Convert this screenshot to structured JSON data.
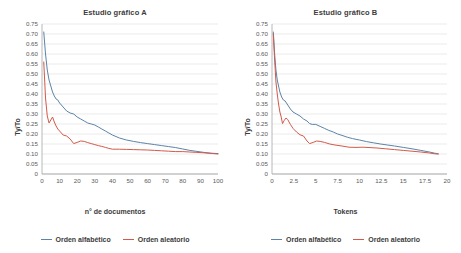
{
  "figure": {
    "background": "#ffffff",
    "series_colors": {
      "alfabetico": "#5b84a8",
      "aleatorio": "#d25a4a"
    },
    "gridline_color": "#e3e3e3",
    "axis_color": "#a6a6a6"
  },
  "legend": {
    "items": [
      {
        "label": "Orden alfabético",
        "color": "#5b84a8",
        "key": "alfabetico"
      },
      {
        "label": "Orden aleatorio",
        "color": "#d25a4a",
        "key": "aleatorio"
      }
    ]
  },
  "panel_a": {
    "title": "Estudio gráfico A",
    "xlabel": "n° de documentos",
    "ylabel": "Ty/To"
  },
  "panel_b": {
    "title": "Estudio gráfico B",
    "xlabel": "Tokens",
    "ylabel": "Ty/To"
  },
  "chart_data": [
    {
      "type": "line",
      "title": "Estudio gráfico A",
      "xlabel": "n° de documentos",
      "ylabel": "Ty/To",
      "xlim": [
        0,
        100
      ],
      "ylim": [
        0,
        0.75
      ],
      "xticks": [
        0,
        10,
        20,
        30,
        40,
        50,
        60,
        70,
        80,
        90,
        100
      ],
      "xtick_labels": [
        "0",
        "10",
        "20",
        "30",
        "40",
        "50",
        "60",
        "70",
        "80",
        "90",
        "100"
      ],
      "yticks": [
        0,
        0.05,
        0.1,
        0.15,
        0.2,
        0.25,
        0.3,
        0.35,
        0.4,
        0.45,
        0.5,
        0.55,
        0.6,
        0.65,
        0.7,
        0.75
      ],
      "ytick_labels": [
        "0",
        "0.05",
        "0.10",
        "0.15",
        "0.20",
        "0.25",
        "0.30",
        "0.35",
        "0.40",
        "0.45",
        "0.50",
        "0.55",
        "0.60",
        "0.65",
        "0.70",
        "0.75"
      ],
      "grid": "horizontal",
      "legend_position": "bottom",
      "series": [
        {
          "name": "Orden alfabético",
          "color": "#5b84a8",
          "x": [
            1,
            2,
            3,
            4,
            5,
            6,
            7,
            8,
            9,
            10,
            12,
            14,
            16,
            18,
            20,
            22,
            24,
            26,
            28,
            30,
            32,
            34,
            36,
            38,
            40,
            44,
            48,
            52,
            56,
            60,
            64,
            68,
            72,
            76,
            80,
            84,
            88,
            92,
            96,
            100
          ],
          "values": [
            0.71,
            0.6,
            0.52,
            0.47,
            0.44,
            0.41,
            0.39,
            0.375,
            0.37,
            0.355,
            0.335,
            0.315,
            0.305,
            0.3,
            0.285,
            0.275,
            0.265,
            0.255,
            0.25,
            0.245,
            0.235,
            0.225,
            0.215,
            0.205,
            0.195,
            0.18,
            0.17,
            0.163,
            0.157,
            0.152,
            0.147,
            0.142,
            0.137,
            0.132,
            0.125,
            0.118,
            0.113,
            0.108,
            0.104,
            0.102
          ]
        },
        {
          "name": "Orden aleatorio",
          "color": "#d25a4a",
          "x": [
            1,
            2,
            3,
            4,
            5,
            6,
            7,
            8,
            9,
            10,
            12,
            14,
            16,
            18,
            20,
            22,
            24,
            26,
            28,
            30,
            32,
            34,
            36,
            38,
            40,
            44,
            48,
            52,
            56,
            60,
            64,
            68,
            72,
            76,
            80,
            84,
            88,
            92,
            96,
            100
          ],
          "values": [
            0.56,
            0.38,
            0.29,
            0.255,
            0.27,
            0.285,
            0.26,
            0.24,
            0.225,
            0.215,
            0.195,
            0.19,
            0.175,
            0.152,
            0.158,
            0.165,
            0.163,
            0.157,
            0.152,
            0.147,
            0.142,
            0.138,
            0.133,
            0.128,
            0.124,
            0.124,
            0.123,
            0.122,
            0.121,
            0.12,
            0.118,
            0.116,
            0.114,
            0.112,
            0.112,
            0.11,
            0.108,
            0.106,
            0.103,
            0.1
          ]
        }
      ]
    },
    {
      "type": "line",
      "title": "Estudio gráfico B",
      "xlabel": "Tokens",
      "ylabel": "Ty/To",
      "xlim": [
        0,
        20
      ],
      "ylim": [
        0,
        0.75
      ],
      "xticks": [
        0,
        2.5,
        5,
        7.5,
        10,
        12.5,
        15,
        17.5,
        20
      ],
      "xtick_labels": [
        "0",
        "2.5",
        "5",
        "7.5",
        "10",
        "12.5",
        "15",
        "17.5",
        "20"
      ],
      "yticks": [
        0,
        0.05,
        0.1,
        0.15,
        0.2,
        0.25,
        0.3,
        0.35,
        0.4,
        0.45,
        0.5,
        0.55,
        0.6,
        0.65,
        0.7,
        0.75
      ],
      "ytick_labels": [
        "0",
        "0.05",
        "0.10",
        "0.15",
        "0.20",
        "0.25",
        "0.30",
        "0.35",
        "0.40",
        "0.45",
        "0.50",
        "0.55",
        "0.60",
        "0.65",
        "0.70",
        "0.75"
      ],
      "grid": "horizontal",
      "legend_position": "bottom",
      "series": [
        {
          "name": "Orden alfabético",
          "color": "#5b84a8",
          "x": [
            0.15,
            0.3,
            0.45,
            0.6,
            0.75,
            0.9,
            1.1,
            1.3,
            1.5,
            1.8,
            2.1,
            2.4,
            2.8,
            3.2,
            3.6,
            4.0,
            4.3,
            4.6,
            5.0,
            5.5,
            6.0,
            6.5,
            7.0,
            7.5,
            8.0,
            8.6,
            9.2,
            10.0,
            10.8,
            11.6,
            12.4,
            13.2,
            14.0,
            15.0,
            16.0,
            17.0,
            18.0,
            18.6,
            19.0
          ],
          "values": [
            0.71,
            0.6,
            0.52,
            0.47,
            0.44,
            0.41,
            0.385,
            0.37,
            0.365,
            0.345,
            0.325,
            0.31,
            0.3,
            0.29,
            0.275,
            0.265,
            0.252,
            0.248,
            0.248,
            0.238,
            0.228,
            0.218,
            0.21,
            0.2,
            0.193,
            0.184,
            0.177,
            0.17,
            0.162,
            0.156,
            0.15,
            0.145,
            0.14,
            0.133,
            0.126,
            0.118,
            0.11,
            0.104,
            0.101
          ]
        },
        {
          "name": "Orden aleatorio",
          "color": "#d25a4a",
          "x": [
            0.15,
            0.3,
            0.45,
            0.6,
            0.75,
            0.9,
            1.05,
            1.2,
            1.4,
            1.6,
            1.8,
            2.1,
            2.4,
            2.8,
            3.2,
            3.6,
            4.0,
            4.3,
            4.7,
            5.1,
            5.5,
            6.0,
            6.6,
            7.2,
            8.0,
            8.8,
            9.6,
            10.4,
            11.2,
            12.0,
            13.0,
            14.0,
            15.0,
            16.0,
            17.0,
            18.0,
            18.6,
            19.0
          ],
          "values": [
            0.7,
            0.57,
            0.46,
            0.4,
            0.35,
            0.31,
            0.285,
            0.252,
            0.268,
            0.28,
            0.272,
            0.248,
            0.228,
            0.21,
            0.196,
            0.19,
            0.165,
            0.152,
            0.158,
            0.165,
            0.163,
            0.158,
            0.15,
            0.145,
            0.14,
            0.134,
            0.133,
            0.134,
            0.132,
            0.13,
            0.126,
            0.122,
            0.118,
            0.114,
            0.11,
            0.105,
            0.101,
            0.1
          ]
        }
      ]
    }
  ]
}
